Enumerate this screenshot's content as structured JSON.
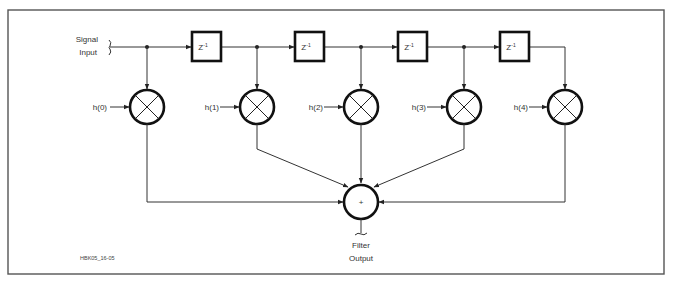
{
  "diagram": {
    "input_label_line1": "Signal",
    "input_label_line2": "Input",
    "output_label_line1": "Filter",
    "output_label_line2": "Output",
    "delay_label": "Z",
    "delay_exponent": "-1",
    "coefficients": [
      "h(0)",
      "h(1)",
      "h(2)",
      "h(3)",
      "h(4)"
    ],
    "adder_symbol": "+",
    "figure_id": "HBK05_16-05",
    "colors": {
      "line": "#333333",
      "block_border": "#111111",
      "frame": "#555555",
      "background": "#ffffff"
    }
  }
}
